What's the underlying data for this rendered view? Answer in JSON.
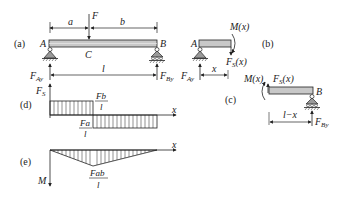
{
  "panels": {
    "a": {
      "tag": "(a)",
      "point_A": "A",
      "point_B": "B",
      "point_C": "C",
      "load": "F",
      "dim_a": "a",
      "dim_b": "b",
      "dim_l": "l",
      "reaction_A": "F",
      "reaction_A_sub": "Ay",
      "reaction_B": "F",
      "reaction_B_sub": "By"
    },
    "b": {
      "tag": "(b)",
      "point_A": "A",
      "moment": "M(x)",
      "shear": "F",
      "shear_sub": "S",
      "shear_arg": "(x)",
      "reaction_A": "F",
      "reaction_A_sub": "Ay",
      "dim_x": "x"
    },
    "c": {
      "tag": "(c)",
      "point_B": "B",
      "moment": "M(x)",
      "shear": "F",
      "shear_sub": "S",
      "shear_arg": "(x)",
      "reaction_B": "F",
      "reaction_B_sub": "By",
      "dim_lx": "l−x"
    },
    "d": {
      "tag": "(d)",
      "axis_y": "F",
      "axis_y_sub": "S",
      "axis_x": "x",
      "pos_num": "Fb",
      "pos_den": "l",
      "neg_num": "Fa",
      "neg_den": "l"
    },
    "e": {
      "tag": "(e)",
      "axis_y": "M",
      "axis_x": "x",
      "peak_num": "Fab",
      "peak_den": "l"
    }
  },
  "colors": {
    "beam_fill": "#c8c8c8",
    "line": "#222222",
    "support_fill": "#9a9a9a"
  }
}
